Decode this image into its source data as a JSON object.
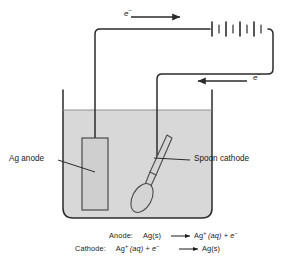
{
  "figure": {
    "colors": {
      "line": "#2b2b2b",
      "solution_fill": "#d8d8d8",
      "electrode_fill": "#cfcfcf",
      "spoon_fill": "#d4d4d4",
      "background": "#ffffff"
    },
    "labels": {
      "anode": "Ag anode",
      "cathode": "Spoon cathode",
      "electron_top": "e",
      "electron_top_charge": "−",
      "electron_bottom": "e",
      "electron_bottom_charge": "−"
    },
    "equations": [
      {
        "name": "anode-equation",
        "heading": "Anode:",
        "reactant": "Ag(s)",
        "arrow": "⟶",
        "product_main": "Ag",
        "product_charge": "+",
        "product_state": "(aq)",
        "plus": "+",
        "product_electron": "e",
        "product_electron_charge": "−"
      },
      {
        "name": "cathode-equation",
        "heading": "Cathode:",
        "reactant_main": "Ag",
        "reactant_charge": "+",
        "reactant_state": "(aq)",
        "plus": "+",
        "reactant_electron": "e",
        "reactant_electron_charge": "−",
        "arrow": "⟶",
        "product": "Ag(s)"
      }
    ],
    "components": {
      "battery": "battery-symbol",
      "beaker": "beaker",
      "solution": "silver-nitrate-solution",
      "ag_electrode": "silver-anode-electrode",
      "spoon": "spoon-cathode-object",
      "wire_left": "wire-anode-to-battery",
      "wire_right": "wire-battery-to-cathode"
    }
  }
}
